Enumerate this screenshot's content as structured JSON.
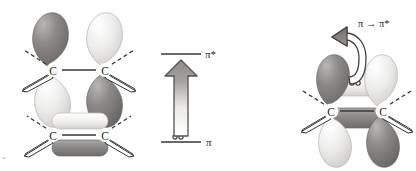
{
  "figure": {
    "name": "pi-to-pi-star-excitation-diagram",
    "caption": ""
  },
  "left_panel": {
    "name": "p-orbital-and-pi-orbital-structures",
    "top_structure": {
      "name": "two-p-orbitals-out-of-phase",
      "atom_left_label": "C",
      "atom_right_label": "C",
      "lobes": [
        {
          "position": "upper-left",
          "phase": "dark",
          "shape": "teardrop"
        },
        {
          "position": "upper-right",
          "phase": "light",
          "shape": "teardrop"
        },
        {
          "position": "lower-left",
          "phase": "light",
          "shape": "teardrop"
        },
        {
          "position": "lower-right",
          "phase": "dark",
          "shape": "teardrop"
        }
      ]
    },
    "bottom_structure": {
      "name": "pi-bonding-orbital",
      "atom_left_label": "C",
      "atom_right_label": "C",
      "lobes": [
        {
          "position": "top",
          "phase": "light",
          "shape": "capsule"
        },
        {
          "position": "bottom",
          "phase": "dark",
          "shape": "capsule"
        }
      ]
    }
  },
  "energy_diagram": {
    "name": "energy-level-diagram",
    "upper_level_label": "π*",
    "lower_level_label": "π",
    "electron_pair_symbol": "○○",
    "electron_count": 2,
    "transition_arrow": {
      "name": "excitation-arrow",
      "direction": "up",
      "from_level": "π",
      "to_level": "π*"
    }
  },
  "right_panel": {
    "name": "excited-state-structure",
    "transition_label": "π → π*",
    "atom_left_label": "C",
    "atom_right_label": "C",
    "electron_pair_symbol": "○○",
    "curved_arrow": {
      "name": "electron-promotion-arrow",
      "from": "pi-orbital",
      "to": "p-orbital"
    },
    "lobes": [
      {
        "position": "upper-left",
        "phase": "dark",
        "shape": "teardrop"
      },
      {
        "position": "upper-right",
        "phase": "light",
        "shape": "teardrop"
      },
      {
        "position": "lower-left",
        "phase": "light",
        "shape": "teardrop"
      },
      {
        "position": "lower-right",
        "phase": "dark",
        "shape": "teardrop"
      },
      {
        "position": "pi-top",
        "phase": "light",
        "shape": "capsule"
      },
      {
        "position": "pi-bottom",
        "phase": "dark",
        "shape": "capsule"
      }
    ]
  },
  "colors": {
    "dark_lobe": "#7c7a78",
    "light_lobe": "#e3e1df",
    "outline": "#3a3735",
    "level_line": "#3a3735",
    "arrow_fill_top": "#8a8886",
    "arrow_fill_bottom": "#ffffff",
    "background": "#ffffff"
  }
}
